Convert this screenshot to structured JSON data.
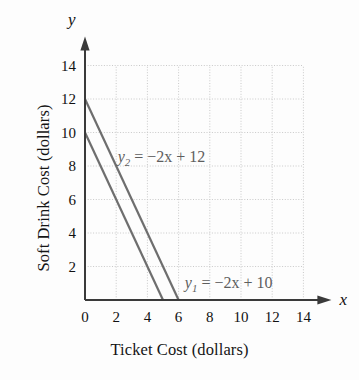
{
  "chart_data": {
    "type": "line",
    "title": "",
    "xlabel": "Ticket Cost (dollars)",
    "ylabel": "Soft Drink Cost (dollars)",
    "xlim": [
      0,
      14
    ],
    "ylim": [
      0,
      14
    ],
    "xticks": [
      "0",
      "2",
      "4",
      "6",
      "8",
      "10",
      "12",
      "14"
    ],
    "yticks": [
      "2",
      "4",
      "6",
      "8",
      "10",
      "12",
      "14"
    ],
    "xtick_values": [
      0,
      2,
      4,
      6,
      8,
      10,
      12,
      14
    ],
    "ytick_values": [
      2,
      4,
      6,
      8,
      10,
      12,
      14
    ],
    "grid": true,
    "grid_style": "dotted",
    "grid_spacing": 2,
    "legend": "none",
    "axis_arrows": true,
    "x_axis_variable": "x",
    "y_axis_variable": "y",
    "line_color": "#6e6e6e",
    "grid_color": "#c9c9c9",
    "axis_color": "#3a3a3a",
    "series": [
      {
        "name": "y2",
        "equation": "y_2 = -2x + 12",
        "label_parts": {
          "var": "y",
          "sub": "2",
          "rest": " = −2x + 12"
        },
        "slope": -2,
        "intercept": 12,
        "x": [
          0,
          6
        ],
        "values": [
          12,
          0
        ],
        "label_position": {
          "x": 2.1,
          "y": 9.0
        }
      },
      {
        "name": "y1",
        "equation": "y_1 = -2x + 10",
        "label_parts": {
          "var": "y",
          "sub": "1",
          "rest": " = −2x + 10"
        },
        "slope": -2,
        "intercept": 10,
        "x": [
          0,
          5
        ],
        "values": [
          10,
          0
        ],
        "label_position": {
          "x": 6.4,
          "y": 1.5
        }
      }
    ]
  }
}
